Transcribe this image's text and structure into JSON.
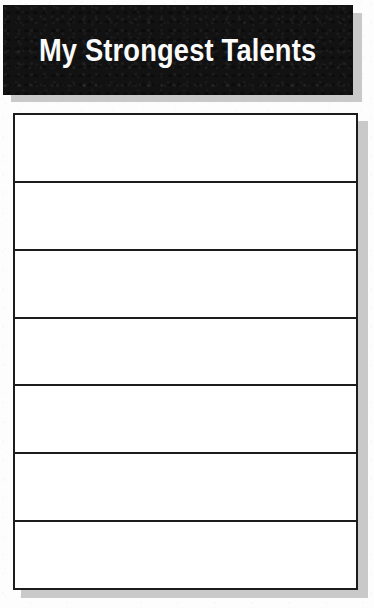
{
  "document": {
    "title": "My Strongest Talents",
    "background_color": "#fdfdfd",
    "banner_color": "#121212",
    "banner_text_color": "#fbfbfb",
    "border_color": "#1c1c1c",
    "shadow_color": "#c9c9c9"
  },
  "header": {
    "title": "My Strongest Talents"
  },
  "worksheet": {
    "row_count": 7,
    "rows": [
      {
        "index": 1,
        "value": ""
      },
      {
        "index": 2,
        "value": ""
      },
      {
        "index": 3,
        "value": ""
      },
      {
        "index": 4,
        "value": ""
      },
      {
        "index": 5,
        "value": ""
      },
      {
        "index": 6,
        "value": ""
      },
      {
        "index": 7,
        "value": ""
      }
    ]
  }
}
